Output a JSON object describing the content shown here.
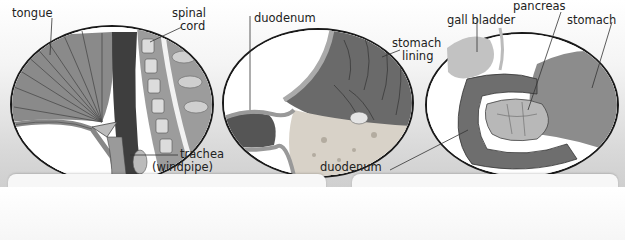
{
  "panels": [
    {
      "name": "throat",
      "labels": {
        "tongue": "tongue",
        "spinal_cord_1": "spinal",
        "spinal_cord_2": "cord",
        "trachea_1": "trachea",
        "trachea_2": "(windpipe)"
      }
    },
    {
      "name": "stomach-section",
      "labels": {
        "duodenum": "duodenum",
        "stomach_lining_1": "stomach",
        "stomach_lining_2": "lining"
      }
    },
    {
      "name": "pancreas-region",
      "labels": {
        "gall_bladder": "gall bladder",
        "pancreas": "pancreas",
        "stomach": "stomach",
        "duodenum": "duodenum"
      }
    }
  ],
  "colors": {
    "outline": "#1a1a1a",
    "tissue_dark": "#5a5a5a",
    "tissue_mid": "#8e8e8e",
    "tissue_light": "#c8c8c8"
  }
}
